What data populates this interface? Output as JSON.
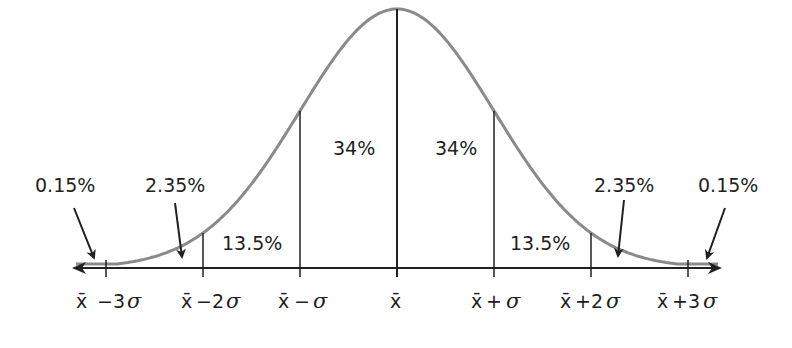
{
  "chart_data": {
    "type": "area",
    "title": "",
    "x_ticks": [
      "x̄ −3σ",
      "x̄ −2σ",
      "x̄ −σ",
      "x̄",
      "x̄ +σ",
      "x̄ +2σ",
      "x̄ +3σ"
    ],
    "x_tick_sigma": [
      -3,
      -2,
      -1,
      0,
      1,
      2,
      3
    ],
    "regions": [
      {
        "from": "-inf",
        "to": -3,
        "percent": "0.15%"
      },
      {
        "from": -3,
        "to": -2,
        "percent": "2.35%"
      },
      {
        "from": -2,
        "to": -1,
        "percent": "13.5%"
      },
      {
        "from": -1,
        "to": 0,
        "percent": "34%"
      },
      {
        "from": 0,
        "to": 1,
        "percent": "34%"
      },
      {
        "from": 1,
        "to": 2,
        "percent": "13.5%"
      },
      {
        "from": 2,
        "to": 3,
        "percent": "2.35%"
      },
      {
        "from": 3,
        "to": "inf",
        "percent": "0.15%"
      }
    ],
    "grid": false,
    "legend": "none"
  },
  "labels": {
    "left_tail": "0.15%",
    "left_2": "2.35%",
    "left_13": "13.5%",
    "left_34": "34%",
    "right_34": "34%",
    "right_13": "13.5%",
    "right_2": "2.35%",
    "right_tail": "0.15%"
  },
  "ticks": {
    "xbar": "x̄",
    "m3": {
      "op": "−3",
      "sym": "σ"
    },
    "m2": {
      "op": "−2",
      "sym": "σ"
    },
    "m1": {
      "op": "−",
      "sym": "σ"
    },
    "p1": {
      "op": "+",
      "sym": "σ"
    },
    "p2": {
      "op": "+2",
      "sym": "σ"
    },
    "p3": {
      "op": "+3",
      "sym": "σ"
    }
  },
  "colors": {
    "curve": "#8a8a8a",
    "lines": "#231f20"
  }
}
